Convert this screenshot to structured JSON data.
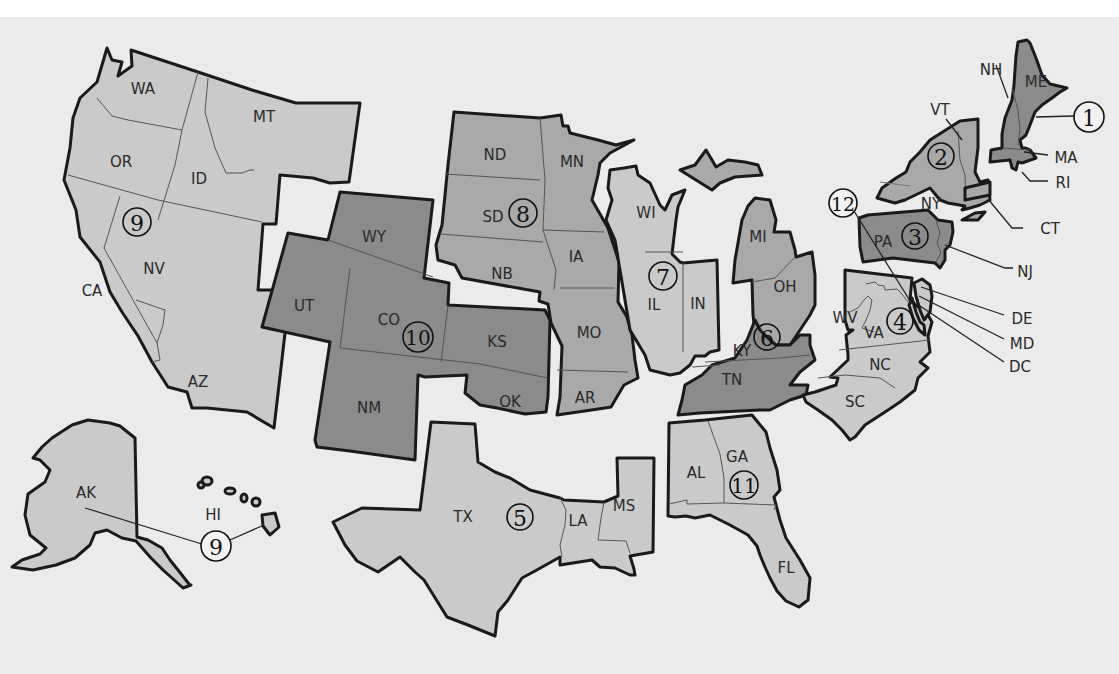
{
  "map": {
    "title": "Federal Reserve Districts",
    "colors": {
      "background": "#ebebeb",
      "light": "#cacaca",
      "medium": "#a9a9a9",
      "dark": "#8b8b8b",
      "border": "#1a1a1a"
    },
    "districts": [
      {
        "number": "1",
        "states": [
          "ME",
          "NH",
          "VT",
          "MA",
          "RI",
          "CT"
        ],
        "shade": "dark"
      },
      {
        "number": "2",
        "states": [
          "NY"
        ],
        "shade": "medium"
      },
      {
        "number": "3",
        "states": [
          "PA",
          "NJ",
          "DE"
        ],
        "shade": "dark"
      },
      {
        "number": "4",
        "states": [
          "OH",
          "KY",
          "PA",
          "WV"
        ],
        "shade": "medium"
      },
      {
        "number": "5",
        "states": [
          "VA",
          "WV",
          "MD",
          "DC",
          "NC",
          "SC"
        ],
        "shade": "light"
      },
      {
        "number": "6",
        "states": [
          "TN",
          "AL",
          "GA",
          "FL",
          "LA",
          "MS"
        ],
        "shade": "dark"
      },
      {
        "number": "7",
        "states": [
          "WI",
          "IL",
          "IN",
          "MI",
          "IA"
        ],
        "shade": "light"
      },
      {
        "number": "8",
        "states": [
          "MO",
          "AR",
          "KY",
          "TN",
          "MS",
          "IL",
          "IN"
        ],
        "shade": "medium"
      },
      {
        "number": "9",
        "states": [
          "MN",
          "ND",
          "SD",
          "MT",
          "WI",
          "MI"
        ],
        "shade": "medium"
      },
      {
        "number": "10",
        "states": [
          "WY",
          "CO",
          "NE",
          "KS",
          "OK",
          "NM",
          "MO"
        ],
        "shade": "dark"
      },
      {
        "number": "11",
        "states": [
          "TX",
          "LA",
          "NM"
        ],
        "shade": "light"
      },
      {
        "number": "12",
        "states": [
          "WA",
          "OR",
          "CA",
          "NV",
          "ID",
          "UT",
          "AZ",
          "AK",
          "HI"
        ],
        "shade": "light"
      }
    ],
    "district_markers": [
      "1",
      "2",
      "3",
      "4",
      "5",
      "6",
      "7",
      "8",
      "9",
      "9",
      "10",
      "11",
      "12"
    ],
    "state_labels": {
      "WA": "WA",
      "OR": "OR",
      "CA": "CA",
      "ID": "ID",
      "NV": "NV",
      "MT": "MT",
      "AZ": "AZ",
      "AK": "AK",
      "HI": "HI",
      "UT": "UT",
      "WY": "WY",
      "CO": "CO",
      "NM": "NM",
      "KS": "KS",
      "OK": "OK",
      "ND": "ND",
      "SD": "SD",
      "NB": "NB",
      "MN": "MN",
      "IA": "IA",
      "MO": "MO",
      "AR": "AR",
      "TX": "TX",
      "LA": "LA",
      "MS": "MS",
      "WI": "WI",
      "IL": "IL",
      "IN": "IN",
      "MI": "MI",
      "OH": "OH",
      "KY": "KY",
      "TN": "TN",
      "AL": "AL",
      "GA": "GA",
      "FL": "FL",
      "WV": "WV",
      "VA": "VA",
      "NC": "NC",
      "SC": "SC",
      "PA": "PA",
      "NJ": "NJ",
      "DE": "DE",
      "MD": "MD",
      "DC": "DC",
      "NY": "NY",
      "VT": "VT",
      "CT": "CT",
      "NH": "NH",
      "ME": "ME",
      "MA": "MA",
      "RI": "RI"
    }
  }
}
